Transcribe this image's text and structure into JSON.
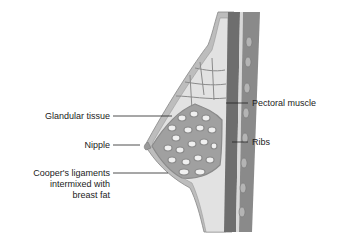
{
  "diagram": {
    "labels": {
      "glandular_tissue": "Glandular tissue",
      "nipple": "Nipple",
      "coopers_line1": "Cooper's ligaments",
      "coopers_line2": "intermixed with",
      "coopers_line3": "breast fat",
      "pectoral_muscle": "Pectoral muscle",
      "ribs": "Ribs"
    },
    "colors": {
      "muscle": "#6e6e6e",
      "fat": "#dcdcdc",
      "gland": "#9a9a9a",
      "skin": "#bdbdbd",
      "rib": "#a8a8a8",
      "text": "#222222"
    }
  }
}
